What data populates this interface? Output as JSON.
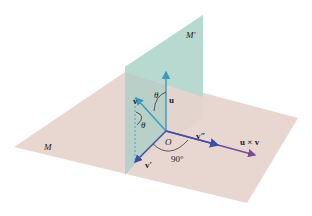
{
  "diagram": {
    "planes": [
      {
        "id": "M",
        "label": "M",
        "color": "#e6d3cc"
      },
      {
        "id": "M-prime",
        "label": "M′",
        "color": "#b7d8cf"
      }
    ],
    "vectors": [
      {
        "id": "u",
        "label": "u",
        "color": "#3a9bbf"
      },
      {
        "id": "v",
        "label": "v",
        "color": "#3a9bbf"
      },
      {
        "id": "v-prime",
        "label": "v′",
        "color": "#3b4fa8"
      },
      {
        "id": "v-double-prime",
        "label": "v″",
        "color": "#3b4fa8"
      },
      {
        "id": "u-cross-v",
        "label": "u × v",
        "color": "#7a4a9a"
      }
    ],
    "origin_label": "O",
    "angles": [
      {
        "id": "theta-upper",
        "label": "θ"
      },
      {
        "id": "theta-lower",
        "label": "θ"
      },
      {
        "id": "right-angle",
        "label": "90°"
      }
    ]
  }
}
